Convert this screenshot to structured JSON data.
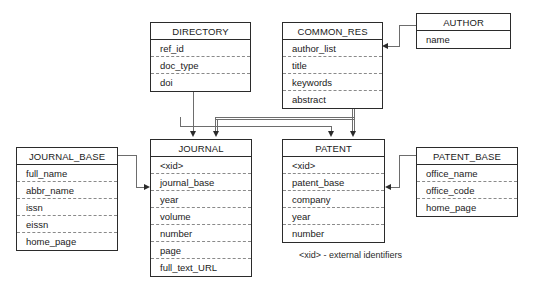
{
  "diagram": {
    "type": "entity-relationship",
    "caption": "<xid> - external identifiers",
    "entities": [
      {
        "id": "directory",
        "name": "DIRECTORY",
        "fields": [
          "ref_id",
          "doc_type",
          "doi"
        ]
      },
      {
        "id": "common_res",
        "name": "COMMON_RES",
        "fields": [
          "author_list",
          "title",
          "keywords",
          "abstract"
        ]
      },
      {
        "id": "author",
        "name": "AUTHOR",
        "fields": [
          "name"
        ]
      },
      {
        "id": "journal_base",
        "name": "JOURNAL_BASE",
        "fields": [
          "full_name",
          "abbr_name",
          "issn",
          "eissn",
          "home_page"
        ]
      },
      {
        "id": "journal",
        "name": "JOURNAL",
        "fields": [
          "<xid>",
          "journal_base",
          "year",
          "volume",
          "number",
          "page",
          "full_text_URL"
        ]
      },
      {
        "id": "patent",
        "name": "PATENT",
        "fields": [
          "<xid>",
          "patent_base",
          "company",
          "year",
          "number"
        ]
      },
      {
        "id": "patent_base",
        "name": "PATENT_BASE",
        "fields": [
          "office_name",
          "office_code",
          "home_page"
        ]
      }
    ],
    "relations": [
      {
        "from": "directory",
        "to": "journal",
        "label": ""
      },
      {
        "from": "common_res",
        "to": "journal",
        "label": ""
      },
      {
        "from": "common_res",
        "to": "patent",
        "label": ""
      },
      {
        "from": "directory",
        "to": "patent",
        "label": ""
      },
      {
        "from": "author",
        "to": "common_res",
        "label": ""
      },
      {
        "from": "journal_base",
        "to": "journal",
        "label": ""
      },
      {
        "from": "patent_base",
        "to": "patent",
        "label": ""
      }
    ],
    "colors": {
      "border": "#2b2b2b",
      "connector": "#6d6d6d",
      "dashed_separator": "#8a8a8a",
      "background": "#ffffff",
      "text": "#1a1a1a"
    }
  }
}
